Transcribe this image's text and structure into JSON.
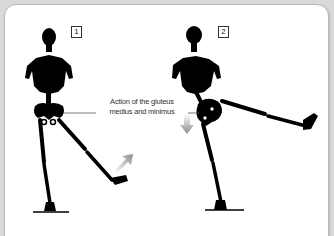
{
  "figure": {
    "panels": [
      {
        "number": "1",
        "pose": "standing, right leg abducted backward-out",
        "arrow_direction": "up-right"
      },
      {
        "number": "2",
        "pose": "standing, right leg raised sideways to horizontal",
        "arrow_direction": "down"
      }
    ],
    "callout": {
      "line1": "Action of the gluteus",
      "line2": "medius and minimus"
    },
    "colors": {
      "background": "#d9d9d9",
      "panel": "#ffffff",
      "skeleton": "#000000",
      "arrow": "#9a9a9a",
      "callout_line": "#555555"
    }
  }
}
